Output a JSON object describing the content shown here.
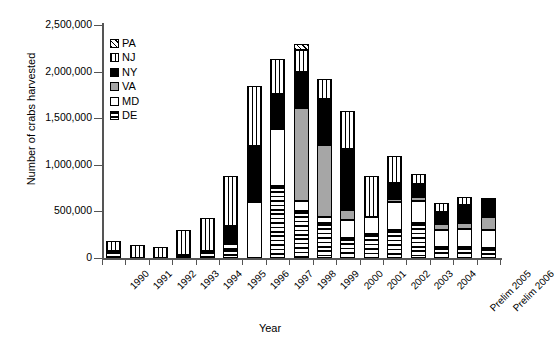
{
  "chart_data": {
    "type": "bar",
    "subtype": "stacked-bar",
    "title": "",
    "xlabel": "Year",
    "ylabel": "Number of crabs harvested",
    "ylim": [
      0,
      2500000
    ],
    "ytick_values": [
      0,
      500000,
      1000000,
      1500000,
      2000000,
      2500000
    ],
    "ytick_labels": [
      "0",
      "500,000",
      "1,000,000",
      "1,500,000",
      "2,000,000",
      "2,500,000"
    ],
    "grid": false,
    "legend_position": "upper-left-inside",
    "legend_order_top_to_bottom": [
      "PA",
      "NJ",
      "NY",
      "VA",
      "MD",
      "DE"
    ],
    "stack_order_bottom_to_top": [
      "DE",
      "MD",
      "VA",
      "NY",
      "NJ",
      "PA"
    ],
    "categories": [
      "1990",
      "1991",
      "1992",
      "1993",
      "1994",
      "1995",
      "1996",
      "1997",
      "1998",
      "1999",
      "2000",
      "2001",
      "2002",
      "2003",
      "2004",
      "Prelim 2005",
      "Prelim 2006"
    ],
    "series": [
      {
        "name": "DE",
        "pattern": "horizontal-lines",
        "values": [
          70000,
          0,
          0,
          30000,
          75000,
          95000,
          0,
          770000,
          500000,
          380000,
          215000,
          255000,
          300000,
          375000,
          115000,
          120000,
          110000
        ]
      },
      {
        "name": "MD",
        "pattern": "white",
        "values": [
          0,
          0,
          0,
          0,
          0,
          55000,
          600000,
          610000,
          110000,
          65000,
          190000,
          190000,
          300000,
          240000,
          190000,
          190000,
          195000
        ]
      },
      {
        "name": "VA",
        "pattern": "gray",
        "values": [
          0,
          0,
          0,
          0,
          0,
          0,
          0,
          0,
          1000000,
          770000,
          110000,
          0,
          35000,
          45000,
          65000,
          65000,
          140000
        ]
      },
      {
        "name": "NY",
        "pattern": "solid-black",
        "values": [
          0,
          0,
          0,
          0,
          0,
          195000,
          600000,
          375000,
          390000,
          495000,
          650000,
          0,
          170000,
          135000,
          125000,
          190000,
          195000
        ]
      },
      {
        "name": "NJ",
        "pattern": "vertical-lines",
        "values": [
          115000,
          140000,
          115000,
          270000,
          355000,
          530000,
          650000,
          380000,
          230000,
          215000,
          410000,
          435000,
          290000,
          110000,
          100000,
          85000,
          0
        ]
      },
      {
        "name": "PA",
        "pattern": "diagonal-hatch",
        "values": [
          0,
          0,
          0,
          0,
          0,
          0,
          0,
          0,
          65000,
          0,
          0,
          0,
          0,
          0,
          0,
          0,
          0
        ]
      }
    ],
    "totals": [
      185000,
      140000,
      115000,
      300000,
      430000,
      875000,
      1850000,
      2135000,
      2295000,
      1925000,
      1575000,
      880000,
      1095000,
      905000,
      595000,
      650000,
      640000
    ],
    "colors": {
      "DE": "#ffffff",
      "MD": "#ffffff",
      "VA": "#a6a6a6",
      "NY": "#000000",
      "NJ": "#ffffff",
      "PA": "#ffffff",
      "axis": "#555555",
      "outline": "#000000",
      "background": "#ffffff"
    }
  },
  "legend": {
    "items": [
      {
        "label": "PA",
        "key": "PA"
      },
      {
        "label": "NJ",
        "key": "NJ"
      },
      {
        "label": "NY",
        "key": "NY"
      },
      {
        "label": "VA",
        "key": "VA"
      },
      {
        "label": "MD",
        "key": "MD"
      },
      {
        "label": "DE",
        "key": "DE"
      }
    ]
  }
}
